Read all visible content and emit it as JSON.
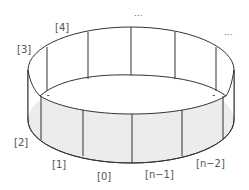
{
  "diagram": {
    "type": "circular-buffer-ring",
    "colors": {
      "stroke": "#333333",
      "outer_wall_fill": "#ececec",
      "inner_fill": "#ffffff"
    },
    "labels": {
      "slot_0": "[0]",
      "slot_1": "[1]",
      "slot_2": "[2]",
      "slot_3": "[3]",
      "slot_4": "[4]",
      "slot_n_minus_1": "[n−1]",
      "slot_n_minus_2": "[n−2]",
      "ellipsis_top": "···",
      "ellipsis_right": "···"
    }
  }
}
